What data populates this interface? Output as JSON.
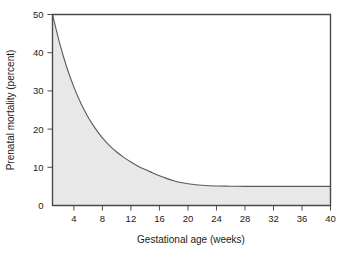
{
  "chart_data": {
    "type": "area",
    "title": "",
    "xlabel": "Gestational age (weeks)",
    "ylabel": "Prenatal mortality (percent)",
    "xlim": [
      1,
      40
    ],
    "ylim": [
      0,
      50
    ],
    "xticks": [
      4,
      8,
      12,
      16,
      20,
      24,
      28,
      32,
      36,
      40
    ],
    "yticks": [
      0,
      10,
      20,
      30,
      40,
      50
    ],
    "grid": false,
    "legend": null,
    "colors": {
      "area_fill": "#e8e8e8",
      "curve_stroke": "#5a5a5a",
      "frame": "#4a4a4a",
      "background": "#ffffff"
    },
    "series": [
      {
        "name": "Prenatal mortality",
        "x": [
          1,
          2,
          3,
          4,
          5,
          6,
          7,
          8,
          9,
          10,
          11,
          12,
          13,
          14,
          15,
          16,
          17,
          18,
          19,
          20,
          22,
          24,
          26,
          28,
          30,
          32,
          34,
          36,
          38,
          40
        ],
        "values": [
          50.0,
          42.5,
          36.2,
          31.0,
          26.7,
          23.1,
          20.2,
          17.7,
          15.7,
          14.0,
          12.6,
          11.4,
          10.3,
          9.4,
          8.6,
          7.8,
          7.1,
          6.5,
          6.0,
          5.7,
          5.3,
          5.1,
          5.05,
          5.0,
          5.0,
          5.0,
          5.0,
          5.0,
          5.0,
          5.0
        ]
      }
    ]
  },
  "axes": {
    "x_tick_labels": [
      "4",
      "8",
      "12",
      "16",
      "20",
      "24",
      "28",
      "32",
      "36",
      "40"
    ],
    "y_tick_labels": [
      "0",
      "10",
      "20",
      "30",
      "40",
      "50"
    ],
    "x_axis_title": "Gestational age (weeks)",
    "y_axis_title": "Prenatal mortality (percent)"
  }
}
